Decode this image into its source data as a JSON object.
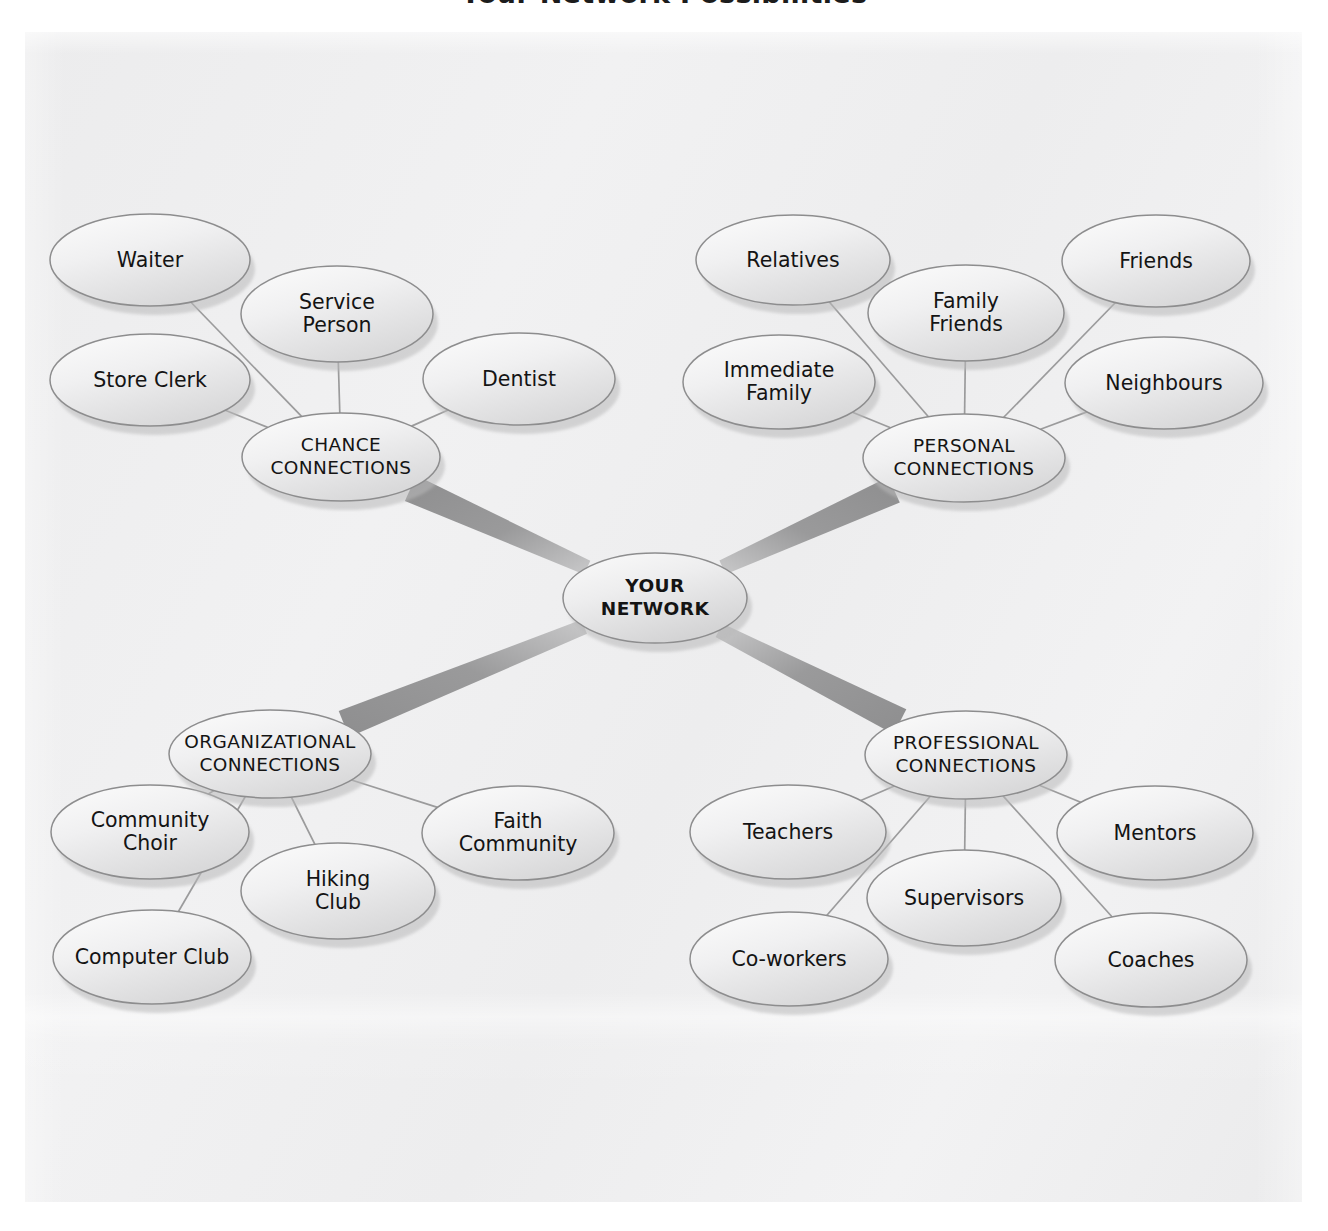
{
  "page": {
    "title": "Your Network Possibilities",
    "background_color": "#ffffff",
    "paper_color": "#eeeeef"
  },
  "colors": {
    "node_fill_light": "#fbfbfb",
    "node_fill_dark": "#dcdcdd",
    "node_stroke": "#8d8d8e",
    "node_shadow": "#b9b9ba",
    "thin_link": "#9b9b9c",
    "thick_link": "#9a9a9b",
    "text": "#141414"
  },
  "chart_data": {
    "type": "diagram",
    "title": "Your Network Possibilities",
    "center": {
      "id": "core",
      "label": "YOUR\nNETWORK",
      "line1": "YOUR",
      "line2": "NETWORK",
      "cx": 655,
      "cy": 598,
      "rx": 92,
      "ry": 45
    },
    "branches": [
      {
        "id": "chance",
        "label": "CHANCE\nCONNECTIONS",
        "line1": "CHANCE",
        "line2": "CONNECTIONS",
        "cx": 341,
        "cy": 457,
        "rx": 99,
        "ry": 44,
        "leaves": [
          {
            "id": "waiter",
            "label": "Waiter",
            "line1": "Waiter",
            "line2": "",
            "cx": 150,
            "cy": 260,
            "rx": 100,
            "ry": 46
          },
          {
            "id": "service-person",
            "label": "Service Person",
            "line1": "Service",
            "line2": "Person",
            "cx": 337,
            "cy": 314,
            "rx": 96,
            "ry": 48
          },
          {
            "id": "store-clerk",
            "label": "Store Clerk",
            "line1": "Store Clerk",
            "line2": "",
            "cx": 150,
            "cy": 380,
            "rx": 100,
            "ry": 46
          },
          {
            "id": "dentist",
            "label": "Dentist",
            "line1": "Dentist",
            "line2": "",
            "cx": 519,
            "cy": 379,
            "rx": 96,
            "ry": 46
          }
        ]
      },
      {
        "id": "personal",
        "label": "PERSONAL\nCONNECTIONS",
        "line1": "PERSONAL",
        "line2": "CONNECTIONS",
        "cx": 964,
        "cy": 458,
        "rx": 101,
        "ry": 44,
        "leaves": [
          {
            "id": "relatives",
            "label": "Relatives",
            "line1": "Relatives",
            "line2": "",
            "cx": 793,
            "cy": 260,
            "rx": 97,
            "ry": 45
          },
          {
            "id": "family-friends",
            "label": "Family Friends",
            "line1": "Family",
            "line2": "Friends",
            "cx": 966,
            "cy": 313,
            "rx": 98,
            "ry": 48
          },
          {
            "id": "friends",
            "label": "Friends",
            "line1": "Friends",
            "line2": "",
            "cx": 1156,
            "cy": 261,
            "rx": 94,
            "ry": 46
          },
          {
            "id": "immediate-family",
            "label": "Immediate Family",
            "line1": "Immediate",
            "line2": "Family",
            "cx": 779,
            "cy": 382,
            "rx": 96,
            "ry": 47
          },
          {
            "id": "neighbours",
            "label": "Neighbours",
            "line1": "Neighbours",
            "line2": "",
            "cx": 1164,
            "cy": 383,
            "rx": 99,
            "ry": 46
          }
        ]
      },
      {
        "id": "organizational",
        "label": "ORGANIZATIONAL\nCONNECTIONS",
        "line1": "ORGANIZATIONAL",
        "line2": "CONNECTIONS",
        "cx": 270,
        "cy": 754,
        "rx": 101,
        "ry": 44,
        "leaves": [
          {
            "id": "community-choir",
            "label": "Community Choir",
            "line1": "Community",
            "line2": "Choir",
            "cx": 150,
            "cy": 832,
            "rx": 99,
            "ry": 47
          },
          {
            "id": "hiking-club",
            "label": "Hiking Club",
            "line1": "Hiking",
            "line2": "Club",
            "cx": 338,
            "cy": 891,
            "rx": 97,
            "ry": 48
          },
          {
            "id": "faith-community",
            "label": "Faith Community",
            "line1": "Faith",
            "line2": "Community",
            "cx": 518,
            "cy": 833,
            "rx": 96,
            "ry": 47
          },
          {
            "id": "computer-club",
            "label": "Computer Club",
            "line1": "Computer Club",
            "line2": "",
            "cx": 152,
            "cy": 957,
            "rx": 99,
            "ry": 47
          }
        ]
      },
      {
        "id": "professional",
        "label": "PROFESSIONAL\nCONNECTIONS",
        "line1": "PROFESSIONAL",
        "line2": "CONNECTIONS",
        "cx": 966,
        "cy": 755,
        "rx": 101,
        "ry": 44,
        "leaves": [
          {
            "id": "teachers",
            "label": "Teachers",
            "line1": "Teachers",
            "line2": "",
            "cx": 788,
            "cy": 832,
            "rx": 98,
            "ry": 47
          },
          {
            "id": "supervisors",
            "label": "Supervisors",
            "line1": "Supervisors",
            "line2": "",
            "cx": 964,
            "cy": 898,
            "rx": 97,
            "ry": 48
          },
          {
            "id": "mentors",
            "label": "Mentors",
            "line1": "Mentors",
            "line2": "",
            "cx": 1155,
            "cy": 833,
            "rx": 98,
            "ry": 47
          },
          {
            "id": "co-workers",
            "label": "Co-workers",
            "line1": "Co-workers",
            "line2": "",
            "cx": 789,
            "cy": 959,
            "rx": 99,
            "ry": 47
          },
          {
            "id": "coaches",
            "label": "Coaches",
            "line1": "Coaches",
            "line2": "",
            "cx": 1151,
            "cy": 960,
            "rx": 96,
            "ry": 47
          }
        ]
      }
    ],
    "thick_links": [
      {
        "from": "core",
        "to": "chance"
      },
      {
        "from": "core",
        "to": "personal"
      },
      {
        "from": "core",
        "to": "organizational"
      },
      {
        "from": "core",
        "to": "professional"
      }
    ]
  }
}
